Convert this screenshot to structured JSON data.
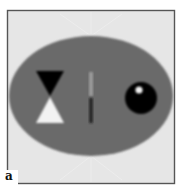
{
  "figure": {
    "panel_label": "a",
    "colors": {
      "background": "#e6e6e6",
      "frame": "#555555",
      "ellipse": "#6a6a6a",
      "dark_feature": "#050505",
      "bright_feature": "#f2f2f2",
      "bar_light": "#9a9a9a",
      "bar_dark": "#2a2a2a",
      "highlight": "#f0f0f0"
    }
  }
}
